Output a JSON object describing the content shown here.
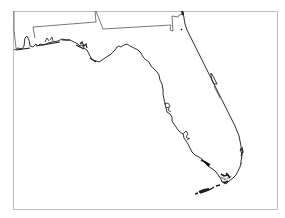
{
  "map": {
    "region": "Florida",
    "colors": {
      "background": "#ffffff",
      "frame": "#bdbdbd",
      "coastline": "#1a1a1a",
      "state_border": "#555555"
    },
    "frame": {
      "x": 13,
      "y": 11,
      "width": 264,
      "height": 198
    }
  }
}
